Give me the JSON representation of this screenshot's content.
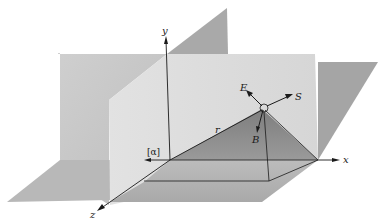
{
  "figure": {
    "type": "3d-coordinate-diagram"
  },
  "axes": {
    "x": "x",
    "y": "y",
    "z": "z"
  },
  "labels": {
    "origin_marker": "[α]",
    "position_vector": "r",
    "electric_field": "E",
    "poynting_vector": "S",
    "magnetic_field": "B"
  },
  "colors": {
    "background": "#ffffff",
    "back_plane": "#c9c9c9",
    "vertical_plane": "#dcdcdc",
    "floor_plane": "#b5b5b5",
    "triangle": "#8e8e8e",
    "lines": "#1a1a1a"
  }
}
